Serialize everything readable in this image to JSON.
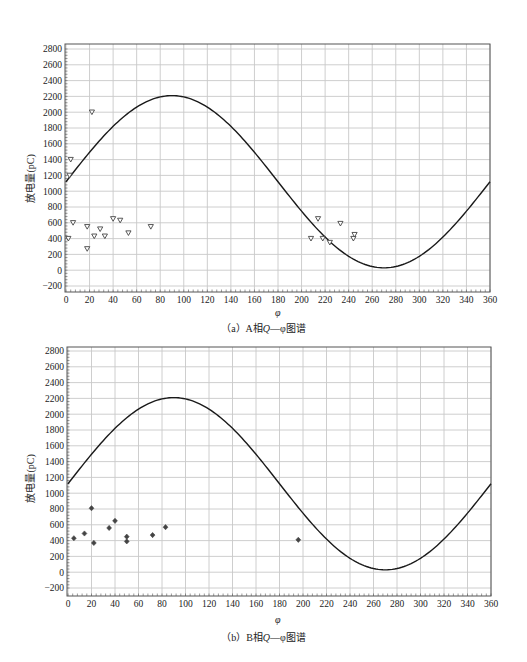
{
  "chart_data": [
    {
      "id": "a",
      "type": "scatter",
      "title": "",
      "caption_prefix": "（a）A相",
      "caption_q": "Q",
      "caption_suffix": "—φ图谱",
      "xlabel": "φ",
      "ylabel": "放电量(pC)",
      "xlim": [
        0,
        360
      ],
      "ylim": [
        -200,
        2800
      ],
      "xticks": [
        0,
        20,
        40,
        60,
        80,
        100,
        120,
        140,
        160,
        180,
        200,
        220,
        240,
        260,
        280,
        300,
        320,
        340,
        360
      ],
      "yticks": [
        -200,
        0,
        200,
        400,
        600,
        800,
        1000,
        1200,
        1400,
        1600,
        1800,
        2000,
        2200,
        2400,
        2600,
        2800
      ],
      "grid": true,
      "legend": "none",
      "marker": "triangle-down",
      "reference_curve": {
        "name": "power-frequency sine reference",
        "offset": 1120,
        "amplitude": 1090,
        "phase_deg": 0
      },
      "series": [
        {
          "name": "A相放电点",
          "points": [
            [
              2,
              400
            ],
            [
              3,
              1200
            ],
            [
              4,
              1400
            ],
            [
              6,
              600
            ],
            [
              22,
              2000
            ],
            [
              18,
              550
            ],
            [
              18,
              270
            ],
            [
              24,
              430
            ],
            [
              29,
              520
            ],
            [
              33,
              430
            ],
            [
              40,
              650
            ],
            [
              46,
              630
            ],
            [
              53,
              470
            ],
            [
              72,
              550
            ],
            [
              208,
              400
            ],
            [
              214,
              650
            ],
            [
              218,
              400
            ],
            [
              224,
              350
            ],
            [
              233,
              590
            ],
            [
              244,
              400
            ],
            [
              245,
              450
            ]
          ]
        }
      ]
    },
    {
      "id": "b",
      "type": "scatter",
      "title": "",
      "caption_prefix": "（b）B相",
      "caption_q": "Q",
      "caption_suffix": "—φ图谱",
      "xlabel": "φ",
      "ylabel": "放电量(pC)",
      "xlim": [
        0,
        360
      ],
      "ylim": [
        -200,
        2800
      ],
      "xticks": [
        0,
        20,
        40,
        60,
        80,
        100,
        120,
        140,
        160,
        180,
        200,
        220,
        240,
        260,
        280,
        300,
        320,
        340,
        360
      ],
      "yticks": [
        -200,
        0,
        200,
        400,
        600,
        800,
        1000,
        1200,
        1400,
        1600,
        1800,
        2000,
        2200,
        2400,
        2600,
        2800
      ],
      "grid": true,
      "legend": "none",
      "marker": "diamond",
      "reference_curve": {
        "name": "power-frequency sine reference",
        "offset": 1120,
        "amplitude": 1090,
        "phase_deg": 0
      },
      "series": [
        {
          "name": "B相放电点",
          "points": [
            [
              5,
              430
            ],
            [
              14,
              490
            ],
            [
              20,
              810
            ],
            [
              22,
              370
            ],
            [
              35,
              560
            ],
            [
              40,
              650
            ],
            [
              50,
              450
            ],
            [
              50,
              390
            ],
            [
              72,
              470
            ],
            [
              83,
              570
            ],
            [
              196,
              410
            ]
          ]
        }
      ]
    }
  ],
  "colors": {
    "grid": "#c8c8c8",
    "frame": "#555555",
    "curve": "#1a1a1a",
    "marker": "#444444",
    "text": "#222222"
  },
  "layout": {
    "a": {
      "left": 66,
      "right": 490,
      "top": 49,
      "bottom": 286,
      "frame_top": 44,
      "frame_bottom": 292,
      "frame_left": 65
    },
    "b": {
      "left": 68,
      "right": 491,
      "top": 16,
      "bottom": 253,
      "frame_top": 12,
      "frame_bottom": 261,
      "frame_left": 67
    }
  }
}
